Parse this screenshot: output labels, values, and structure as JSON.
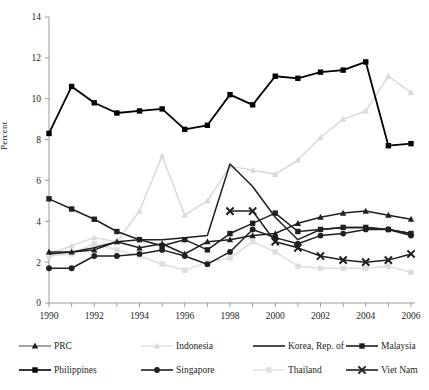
{
  "chart_data": {
    "type": "line",
    "title": "",
    "xlabel": "",
    "ylabel": "Percent",
    "x": [
      1990,
      1991,
      1992,
      1993,
      1994,
      1995,
      1996,
      1997,
      1998,
      1999,
      2000,
      2001,
      2002,
      2003,
      2004,
      2005,
      2006
    ],
    "xlim": [
      1990,
      2006
    ],
    "ylim": [
      0,
      14
    ],
    "yticks": [
      0,
      2,
      4,
      6,
      8,
      10,
      12,
      14
    ],
    "xticks": [
      1990,
      1992,
      1994,
      1996,
      1998,
      2000,
      2002,
      2004,
      2006
    ],
    "xtick_labels": [
      "1990",
      "1992",
      "1994",
      "1996",
      "1998",
      "2000",
      "2002",
      "2004",
      "2006"
    ],
    "ytick_labels": [
      "0",
      "2",
      "4",
      "6",
      "8",
      "10",
      "12",
      "14"
    ],
    "grid": false,
    "legend_position": "below",
    "series": [
      {
        "name": "PRC",
        "marker": "triangle",
        "color": "#231f20",
        "x": [
          1990,
          1991,
          1992,
          1993,
          1994,
          1995,
          1996,
          1997,
          1998,
          1999,
          2000,
          2001,
          2002,
          2003,
          2004,
          2005,
          2006
        ],
        "values": [
          2.5,
          2.5,
          2.6,
          3.0,
          2.7,
          2.9,
          2.4,
          3.0,
          3.1,
          3.3,
          3.4,
          3.9,
          4.2,
          4.4,
          4.5,
          4.3,
          4.1
        ]
      },
      {
        "name": "Indonesia",
        "marker": "triangle",
        "color": "#d9d9d9",
        "x": [
          1990,
          1991,
          1992,
          1993,
          1994,
          1995,
          1996,
          1997,
          1998,
          1999,
          2000,
          2001,
          2002,
          2003,
          2004,
          2005,
          2006
        ],
        "values": [
          2.4,
          2.8,
          3.2,
          3.0,
          4.5,
          7.2,
          4.3,
          5.0,
          6.7,
          6.5,
          6.3,
          7.0,
          8.1,
          9.0,
          9.4,
          11.1,
          10.3
        ]
      },
      {
        "name": "Korea, Rep. of",
        "marker": "none",
        "color": "#231f20",
        "x": [
          1990,
          1991,
          1992,
          1993,
          1994,
          1995,
          1996,
          1997,
          1998,
          1999,
          2000,
          2001,
          2002,
          2003,
          2004,
          2005,
          2006
        ],
        "values": [
          2.4,
          2.5,
          2.7,
          3.0,
          3.1,
          3.1,
          3.2,
          3.3,
          6.8,
          5.7,
          4.2,
          3.1,
          3.6,
          3.7,
          3.7,
          3.6,
          3.4
        ]
      },
      {
        "name": "Malaysia",
        "marker": "square",
        "color": "#231f20",
        "x": [
          1990,
          1991,
          1992,
          1993,
          1994,
          1995,
          1996,
          1997,
          1998,
          1999,
          2000,
          2001,
          2002,
          2003,
          2004,
          2005,
          2006
        ],
        "values": [
          5.1,
          4.6,
          4.1,
          3.5,
          3.1,
          2.8,
          3.1,
          2.6,
          3.4,
          3.9,
          4.4,
          3.5,
          3.6,
          3.7,
          3.7,
          3.6,
          3.4
        ]
      },
      {
        "name": "Philippines",
        "marker": "square",
        "color": "#000000",
        "x": [
          1990,
          1991,
          1992,
          1993,
          1994,
          1995,
          1996,
          1997,
          1998,
          1999,
          2000,
          2001,
          2002,
          2003,
          2004,
          2005,
          2006
        ],
        "values": [
          8.3,
          10.6,
          9.8,
          9.3,
          9.4,
          9.5,
          8.5,
          8.7,
          10.2,
          9.7,
          11.1,
          11.0,
          11.3,
          11.4,
          11.8,
          7.7,
          7.8
        ]
      },
      {
        "name": "Singapore",
        "marker": "circle",
        "color": "#231f20",
        "x": [
          1990,
          1991,
          1992,
          1993,
          1994,
          1995,
          1996,
          1997,
          1998,
          1999,
          2000,
          2001,
          2002,
          2003,
          2004,
          2005,
          2006
        ],
        "values": [
          1.7,
          1.7,
          2.3,
          2.3,
          2.4,
          2.6,
          2.3,
          1.9,
          2.5,
          3.6,
          3.2,
          2.9,
          3.3,
          3.4,
          3.6,
          3.6,
          3.3
        ]
      },
      {
        "name": "Thailand",
        "marker": "square",
        "color": "#dedede",
        "x": [
          1990,
          1991,
          1992,
          1993,
          1994,
          1995,
          1996,
          1997,
          1998,
          1999,
          2000,
          2001,
          2002,
          2003,
          2004,
          2005,
          2006
        ],
        "values": [
          2.3,
          2.4,
          2.9,
          2.6,
          2.3,
          1.9,
          1.6,
          2.0,
          2.2,
          3.0,
          2.5,
          1.8,
          1.7,
          1.7,
          1.7,
          1.8,
          1.5
        ]
      },
      {
        "name": "Viet Nam",
        "marker": "x",
        "color": "#231f20",
        "x": [
          1998,
          1999,
          2000,
          2001,
          2002,
          2003,
          2004,
          2005,
          2006
        ],
        "values": [
          4.5,
          4.5,
          3.0,
          2.7,
          2.3,
          2.1,
          2.0,
          2.1,
          2.4
        ]
      }
    ]
  },
  "legend": {
    "items": [
      {
        "label": "PRC",
        "marker": "triangle",
        "color": "#231f20",
        "line": "#8c8c8c"
      },
      {
        "label": "Indonesia",
        "marker": "triangle",
        "color": "#d9d9d9",
        "line": "#e4e4e4"
      },
      {
        "label": "Korea, Rep. of",
        "marker": "none",
        "color": "#231f20",
        "line": "#231f20"
      },
      {
        "label": "Malaysia",
        "marker": "square",
        "color": "#231f20",
        "line": "#231f20"
      },
      {
        "label": "Philippines",
        "marker": "square",
        "color": "#000000",
        "line": "#000000"
      },
      {
        "label": "Singapore",
        "marker": "circle",
        "color": "#231f20",
        "line": "#231f20"
      },
      {
        "label": "Thailand",
        "marker": "square",
        "color": "#dedede",
        "line": "#e4e4e4"
      },
      {
        "label": "Viet Nam",
        "marker": "x",
        "color": "#231f20",
        "line": "#231f20"
      }
    ]
  }
}
